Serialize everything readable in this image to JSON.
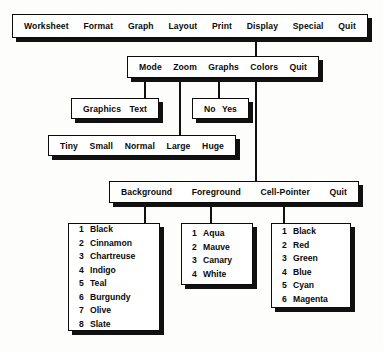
{
  "diagram": {
    "line_color": "#111111",
    "box_fill": "#ffffff",
    "box_border": "#0c0c0c"
  },
  "main_menu": {
    "name": "worksheet-menu-bar",
    "items": [
      "Worksheet",
      "Format",
      "Graph",
      "Layout",
      "Print",
      "Display",
      "Special",
      "Quit"
    ]
  },
  "display_menu": {
    "name": "display-submenu",
    "parent": "Display",
    "items": [
      "Mode",
      "Zoom",
      "Graphs",
      "Colors",
      "Quit"
    ]
  },
  "mode_menu": {
    "name": "mode-submenu",
    "parent": "Mode",
    "items": [
      "Graphics",
      "Text"
    ]
  },
  "graphs_menu": {
    "name": "graphs-submenu",
    "parent": "Graphs",
    "items": [
      "No",
      "Yes"
    ]
  },
  "zoom_menu": {
    "name": "zoom-submenu",
    "parent": "Zoom",
    "items": [
      "Tiny",
      "Small",
      "Normal",
      "Large",
      "Huge"
    ]
  },
  "colors_menu": {
    "name": "colors-submenu",
    "parent": "Colors",
    "items": [
      "Background",
      "Foreground",
      "Cell-Pointer",
      "Quit"
    ]
  },
  "background_colors": {
    "name": "background-color-list",
    "parent": "Background",
    "options": [
      {
        "num": "1",
        "label": "Black"
      },
      {
        "num": "2",
        "label": "Cinnamon"
      },
      {
        "num": "3",
        "label": "Chartreuse"
      },
      {
        "num": "4",
        "label": "Indigo"
      },
      {
        "num": "5",
        "label": "Teal"
      },
      {
        "num": "6",
        "label": "Burgundy"
      },
      {
        "num": "7",
        "label": "Olive"
      },
      {
        "num": "8",
        "label": "Slate"
      }
    ]
  },
  "foreground_colors": {
    "name": "foreground-color-list",
    "parent": "Foreground",
    "options": [
      {
        "num": "1",
        "label": "Aqua"
      },
      {
        "num": "2",
        "label": "Mauve"
      },
      {
        "num": "3",
        "label": "Canary"
      },
      {
        "num": "4",
        "label": "White"
      }
    ]
  },
  "cell_pointer_colors": {
    "name": "cell-pointer-color-list",
    "parent": "Cell-Pointer",
    "options": [
      {
        "num": "1",
        "label": "Black"
      },
      {
        "num": "2",
        "label": "Red"
      },
      {
        "num": "3",
        "label": "Green"
      },
      {
        "num": "4",
        "label": "Blue"
      },
      {
        "num": "5",
        "label": "Cyan"
      },
      {
        "num": "6",
        "label": "Magenta"
      }
    ]
  }
}
